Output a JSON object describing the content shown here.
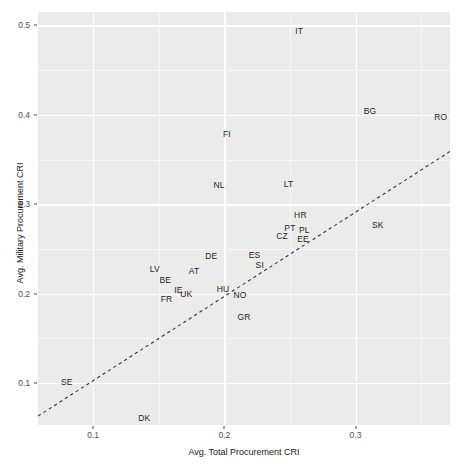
{
  "chart_data": {
    "type": "scatter",
    "title": "",
    "subtitle": "",
    "xlabel": "Avg. Total Procurement CRI",
    "ylabel": "Avg. Military Procurement CRI",
    "xlim": [
      0.058,
      0.372
    ],
    "ylim": [
      0.053,
      0.515
    ],
    "xticks": [
      0.1,
      0.2,
      0.3
    ],
    "xtick_labels": [
      "0.1",
      "0.2",
      "0.3"
    ],
    "yticks": [
      0.1,
      0.2,
      0.3,
      0.4,
      0.5
    ],
    "ytick_labels": [
      "0.1",
      "0.2",
      "0.3",
      "0.4",
      "0.5"
    ],
    "grid": true,
    "legend": null,
    "point_style": "text-labels",
    "points": [
      {
        "label": "IT",
        "x": 0.257,
        "y": 0.494
      },
      {
        "label": "BG",
        "x": 0.311,
        "y": 0.404
      },
      {
        "label": "RO",
        "x": 0.365,
        "y": 0.397
      },
      {
        "label": "FI",
        "x": 0.202,
        "y": 0.378
      },
      {
        "label": "NL",
        "x": 0.196,
        "y": 0.322
      },
      {
        "label": "LT",
        "x": 0.249,
        "y": 0.323
      },
      {
        "label": "HR",
        "x": 0.258,
        "y": 0.288
      },
      {
        "label": "SK",
        "x": 0.317,
        "y": 0.277
      },
      {
        "label": "PT",
        "x": 0.25,
        "y": 0.273
      },
      {
        "label": "PL",
        "x": 0.261,
        "y": 0.271
      },
      {
        "label": "CZ",
        "x": 0.244,
        "y": 0.264
      },
      {
        "label": "EE",
        "x": 0.26,
        "y": 0.261
      },
      {
        "label": "ES",
        "x": 0.223,
        "y": 0.243
      },
      {
        "label": "DE",
        "x": 0.19,
        "y": 0.242
      },
      {
        "label": "SI",
        "x": 0.227,
        "y": 0.232
      },
      {
        "label": "AT",
        "x": 0.177,
        "y": 0.225
      },
      {
        "label": "LV",
        "x": 0.147,
        "y": 0.227
      },
      {
        "label": "BE",
        "x": 0.155,
        "y": 0.215
      },
      {
        "label": "HU",
        "x": 0.199,
        "y": 0.205
      },
      {
        "label": "IE",
        "x": 0.165,
        "y": 0.204
      },
      {
        "label": "UK",
        "x": 0.171,
        "y": 0.199
      },
      {
        "label": "NO",
        "x": 0.212,
        "y": 0.198
      },
      {
        "label": "FR",
        "x": 0.156,
        "y": 0.194
      },
      {
        "label": "GR",
        "x": 0.215,
        "y": 0.174
      },
      {
        "label": "SE",
        "x": 0.08,
        "y": 0.101
      },
      {
        "label": "DK",
        "x": 0.139,
        "y": 0.061
      }
    ],
    "reference_line": {
      "style": "dashed",
      "color": "#333333",
      "x_start": 0.058,
      "y_start": 0.063,
      "x_end": 0.372,
      "y_end": 0.359
    }
  },
  "axes": {
    "x_label": "Avg. Total Procurement CRI",
    "y_label": "Avg. Military Procurement CRI"
  }
}
